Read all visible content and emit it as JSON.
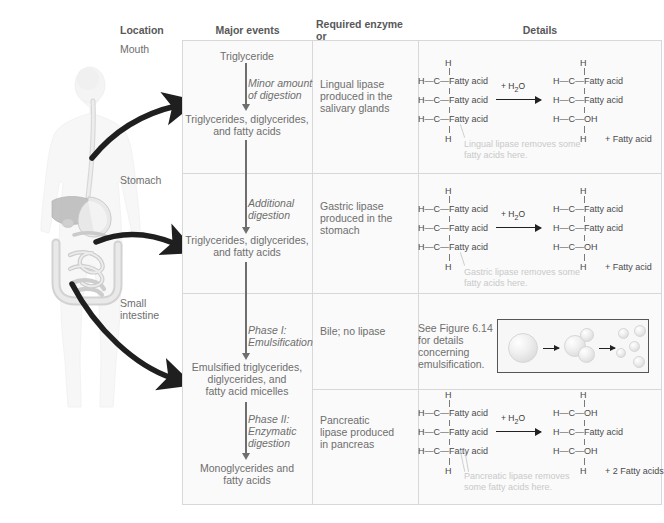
{
  "headers": {
    "location": "Location",
    "major_events": "Major events",
    "enzyme": "Required enzyme or\nsecretion and source",
    "enzyme_line1": "Required enzyme or",
    "enzyme_line2": "secretion and source",
    "details": "Details"
  },
  "locations": [
    {
      "label": "Mouth"
    },
    {
      "label": "Stomach"
    },
    {
      "label": "Small\nintestine",
      "line1": "Small",
      "line2": "intestine"
    }
  ],
  "major_events": {
    "triglyceride": "Triglyceride",
    "minor_digestion": "Minor amount\nof digestion",
    "minor_l1": "Minor amount",
    "minor_l2": "of digestion",
    "tg_dg_fa_1": "Triglycerides, diglycerides,\nand fatty acids",
    "tg_dg_fa_1_l1": "Triglycerides, diglycerides,",
    "tg_dg_fa_1_l2": "and fatty acids",
    "additional_digestion_l1": "Additional",
    "additional_digestion_l2": "digestion",
    "tg_dg_fa_2_l1": "Triglycerides, diglycerides,",
    "tg_dg_fa_2_l2": "and fatty acids",
    "phase1_l1": "Phase I:",
    "phase1_l2": "Emulsification",
    "emulsified_l1": "Emulsified triglycerides,",
    "emulsified_l2": "diglycerides, and",
    "emulsified_l3": "fatty acid micelles",
    "phase2_l1": "Phase II:",
    "phase2_l2": "Enzymatic",
    "phase2_l3": "digestion",
    "monoglycerides_l1": "Monoglycerides and",
    "monoglycerides_l2": "fatty acids"
  },
  "enzymes": [
    {
      "line1": "Lingual lipase",
      "line2": "produced in the",
      "line3": "salivary glands"
    },
    {
      "line1": "Gastric lipase",
      "line2": "produced in the",
      "line3": "stomach"
    },
    {
      "line1": "Bile; no lipase",
      "line2": "",
      "line3": ""
    },
    {
      "line1": "Pancreatic",
      "line2": "lipase produced",
      "line3": "in pancreas"
    }
  ],
  "details": {
    "see_figure_l1": "See Figure 6.14",
    "see_figure_l2": "for details",
    "see_figure_l3": "concerning",
    "see_figure_l4": "emulsification.",
    "water": "+ H2O",
    "water_html": "+ H<sub>2</sub>O"
  },
  "reactions": [
    {
      "id": "lingual",
      "reactant": {
        "top_h": "H",
        "rows": [
          "Fatty acid",
          "Fatty acid",
          "Fatty acid"
        ],
        "bottom_h": "H"
      },
      "product": {
        "top_h": "H",
        "rows": [
          "Fatty acid",
          "Fatty acid",
          "OH"
        ],
        "bottom_h": "H"
      },
      "byproduct": "+ Fatty acid",
      "caption_l1": "Lingual lipase removes some",
      "caption_l2": "fatty acids here."
    },
    {
      "id": "gastric",
      "reactant": {
        "top_h": "H",
        "rows": [
          "Fatty acid",
          "Fatty acid",
          "Fatty acid"
        ],
        "bottom_h": "H"
      },
      "product": {
        "top_h": "H",
        "rows": [
          "Fatty acid",
          "Fatty acid",
          "OH"
        ],
        "bottom_h": "H"
      },
      "byproduct": "+ Fatty acid",
      "caption_l1": "Gastric lipase removes some",
      "caption_l2": "fatty acids here."
    },
    {
      "id": "pancreatic",
      "reactant": {
        "top_h": "H",
        "rows": [
          "Fatty acid",
          "Fatty acid",
          "Fatty acid"
        ],
        "bottom_h": "H"
      },
      "product": {
        "top_h": "H",
        "rows": [
          "OH",
          "Fatty acid",
          "OH"
        ],
        "bottom_h": "H"
      },
      "byproduct": "+ 2 Fatty acids",
      "caption_l1": "Pancreatic lipase removes",
      "caption_l2": "some fatty acids here."
    }
  ],
  "atoms": {
    "h": "H",
    "c": "C"
  },
  "colors": {
    "text": "#6e6e6e",
    "header_text": "#58585a",
    "caption_gray": "#c9c9c9",
    "grid": "#d8d8d8",
    "panel_bg": "#fafafa",
    "arrow_black": "#222222"
  }
}
